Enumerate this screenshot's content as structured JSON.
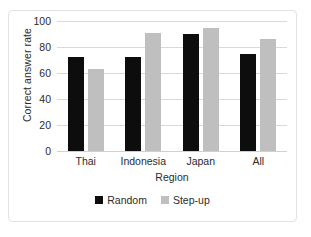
{
  "chart_data": {
    "type": "bar",
    "title": "",
    "xlabel": "Region",
    "ylabel": "Correct answer rate",
    "categories": [
      "Thai",
      "Indonesia",
      "Japan",
      "All"
    ],
    "series": [
      {
        "name": "Random",
        "color": "#0d0d0d",
        "values": [
          72,
          72,
          90,
          75
        ]
      },
      {
        "name": "Step-up",
        "color": "#bfbfbf",
        "values": [
          63,
          91,
          95,
          86
        ]
      }
    ],
    "ylim": [
      0,
      100
    ],
    "yticks": [
      0,
      20,
      40,
      60,
      80,
      100
    ],
    "ytick_labels": [
      "0",
      "20",
      "40",
      "60",
      "80",
      "100"
    ],
    "grid": true,
    "legend_position": "bottom",
    "legend_entries": [
      "Random",
      "Step-up"
    ]
  }
}
